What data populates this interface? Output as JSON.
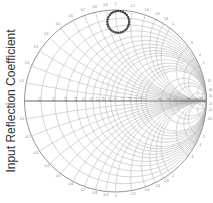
{
  "chart_data": {
    "type": "scatter",
    "subtype": "smith_chart",
    "title": "",
    "ylabel": "Input Reflection Coefficient",
    "xlabel": "",
    "grid": true,
    "legend": null,
    "resistance_circles": [
      0.1,
      0.2,
      0.3,
      0.4,
      0.5,
      0.6,
      0.7,
      0.8,
      0.9,
      1.0,
      1.2,
      1.4,
      1.6,
      1.8,
      2.0,
      3.0,
      4.0,
      5.0,
      10,
      20,
      50
    ],
    "reactance_arcs": [
      0.1,
      0.2,
      0.3,
      0.4,
      0.5,
      0.6,
      0.7,
      0.8,
      0.9,
      1.0,
      1.2,
      1.4,
      1.6,
      1.8,
      2.0,
      3.0,
      4.0,
      5.0,
      10,
      20,
      50
    ],
    "series": [
      {
        "name": "S11",
        "marker": "dot",
        "color": "#444444",
        "description": "closed loop of markers forming a small circle near top of chart",
        "center_gamma": [
          0.03,
          0.87
        ],
        "radius_gamma": 0.12,
        "num_points": 28
      }
    ]
  },
  "colors": {
    "grid": "#bbbbbb",
    "axis": "#555555",
    "marker": "#444444"
  }
}
